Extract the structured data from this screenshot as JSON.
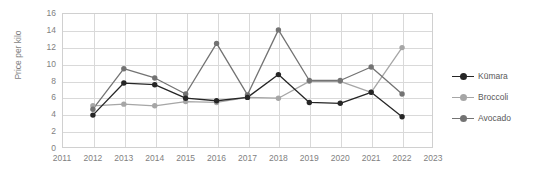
{
  "chart_data": {
    "type": "line",
    "title": "",
    "xlabel": "",
    "ylabel": "Price per kilo",
    "x": [
      2012,
      2013,
      2014,
      2015,
      2016,
      2017,
      2018,
      2019,
      2020,
      2021,
      2022
    ],
    "xlim": [
      2011,
      2023
    ],
    "ylim": [
      0,
      16
    ],
    "ytick_step": 2,
    "xticks": [
      "2011",
      "2012",
      "2013",
      "2014",
      "2015",
      "2016",
      "2017",
      "2018",
      "2019",
      "2020",
      "2021",
      "2022",
      "2023"
    ],
    "yticks": [
      "0",
      "2",
      "4",
      "6",
      "8",
      "10",
      "12",
      "14",
      "16"
    ],
    "grid": true,
    "legend_position": "right",
    "series": [
      {
        "name": "Kūmara",
        "color": "#262626",
        "values": [
          3.9,
          7.7,
          7.5,
          5.9,
          5.6,
          6.0,
          8.7,
          5.4,
          5.3,
          6.6,
          3.7
        ]
      },
      {
        "name": "Broccoli",
        "color": "#a6a6a6",
        "values": [
          5.0,
          5.2,
          5.0,
          5.5,
          5.4,
          6.0,
          5.9,
          7.9,
          7.9,
          6.6,
          11.9
        ]
      },
      {
        "name": "Avocado",
        "color": "#737373",
        "values": [
          4.6,
          9.4,
          8.3,
          6.4,
          12.4,
          6.3,
          14.0,
          8.0,
          8.0,
          9.6,
          6.4
        ]
      }
    ]
  },
  "axis": {
    "y_title": "Price per kilo"
  },
  "legend": {
    "items": [
      {
        "label": "Kūmara"
      },
      {
        "label": "Broccoli"
      },
      {
        "label": "Avocado"
      }
    ]
  }
}
